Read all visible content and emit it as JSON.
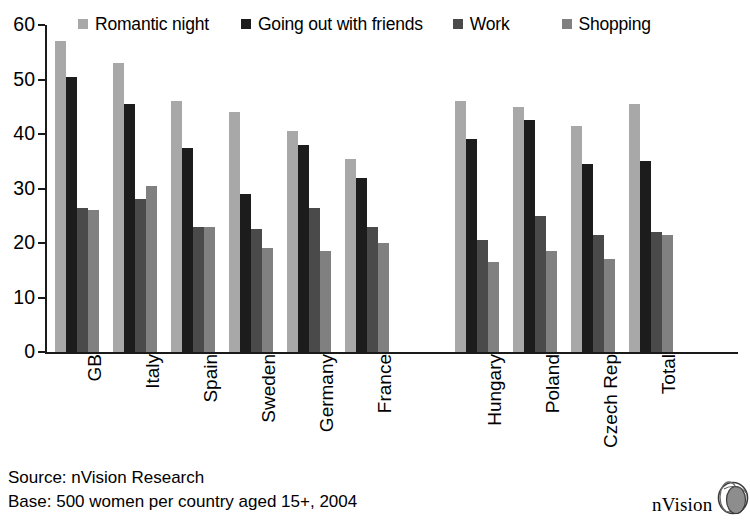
{
  "chart_data": {
    "type": "bar",
    "title": "",
    "subtitle": "",
    "xlabel": "",
    "ylabel": "",
    "ylim": [
      0,
      60
    ],
    "yticks": [
      0,
      10,
      20,
      30,
      40,
      50,
      60
    ],
    "grid": false,
    "legend_position": "top",
    "categories": [
      "GB",
      "Italy",
      "Spain",
      "Sweden",
      "Germany",
      "France",
      "Hungary",
      "Poland",
      "Czech Rep",
      "Total"
    ],
    "series": [
      {
        "name": "Romantic night",
        "color": "#a8a8a8",
        "values": [
          57,
          53,
          46,
          44,
          40.5,
          35.5,
          46,
          45,
          41.5,
          45.5
        ]
      },
      {
        "name": "Going out with friends",
        "color": "#1c1c1c",
        "values": [
          50.5,
          45.5,
          37.5,
          29,
          38,
          32,
          39,
          42.5,
          34.5,
          35
        ]
      },
      {
        "name": "Work",
        "color": "#4a4a4a",
        "values": [
          26.5,
          28,
          23,
          22.5,
          26.5,
          23,
          20.5,
          25,
          21.5,
          22
        ]
      },
      {
        "name": "Shopping",
        "color": "#808080",
        "values": [
          26,
          30.5,
          23,
          19,
          18.5,
          20,
          16.5,
          18.5,
          17,
          21.5
        ]
      }
    ],
    "group_gap_after": "France",
    "annotations": []
  },
  "legend": {
    "items": [
      {
        "label": "Romantic night",
        "color": "#a8a8a8"
      },
      {
        "label": "Going out with friends",
        "color": "#1c1c1c"
      },
      {
        "label": "Work",
        "color": "#4a4a4a"
      },
      {
        "label": "Shopping",
        "color": "#808080"
      }
    ]
  },
  "axis": {
    "y_tick_labels": [
      "60",
      "50",
      "40",
      "30",
      "20",
      "10",
      "0"
    ]
  },
  "footer": {
    "source_line": "Source: nVision Research",
    "base_line": "Base: 500 women per country aged 15+, 2004"
  },
  "logo": {
    "text": "nVision",
    "mark": "globe-icon"
  }
}
